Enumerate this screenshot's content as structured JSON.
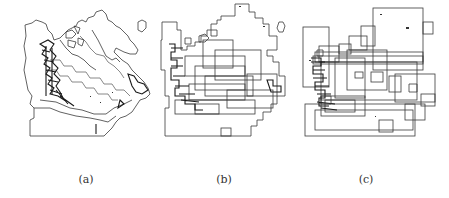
{
  "figure": {
    "panels": [
      {
        "id": "a",
        "caption": "(a)",
        "description": "Map of Canada with region boundaries (original polygon data)"
      },
      {
        "id": "b",
        "caption": "(b)",
        "description": "Map of Canada approximated with rectilinear staircase regions"
      },
      {
        "id": "c",
        "caption": "(c)",
        "description": "Map of Canada decomposed into overlapping bounding rectangles"
      }
    ]
  }
}
